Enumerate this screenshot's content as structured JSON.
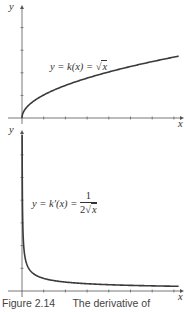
{
  "chart_data": [
    {
      "type": "line",
      "title": "",
      "function_label": "y = k(x) = √x",
      "xlabel": "x",
      "ylabel": "y",
      "grid": false,
      "x_ticks_count": 7,
      "y_ticks_count": 4,
      "series": [
        {
          "name": "k(x) = sqrt(x)",
          "x": [
            0,
            0.25,
            0.5,
            1,
            2,
            3,
            4,
            5,
            6,
            7
          ],
          "values": [
            0,
            0.5,
            0.71,
            1,
            1.41,
            1.73,
            2,
            2.24,
            2.45,
            2.65
          ]
        }
      ],
      "xlim": [
        0,
        7.3
      ],
      "ylim": [
        0,
        4.9
      ]
    },
    {
      "type": "line",
      "title": "",
      "function_label": "y = k'(x) = 1 / (2√x)",
      "xlabel": "x",
      "ylabel": "y",
      "grid": false,
      "x_ticks_count": 7,
      "y_ticks_count": 6,
      "series": [
        {
          "name": "k'(x) = 1/(2 sqrt(x))",
          "x": [
            0.01,
            0.05,
            0.1,
            0.25,
            0.5,
            1,
            2,
            3,
            4,
            5,
            6,
            7
          ],
          "values": [
            5,
            2.24,
            1.58,
            1,
            0.71,
            0.5,
            0.35,
            0.29,
            0.25,
            0.22,
            0.2,
            0.19
          ]
        }
      ],
      "xlim": [
        0,
        7.3
      ],
      "ylim": [
        0,
        6.4
      ]
    }
  ],
  "labels": {
    "top_y_axis": "y",
    "top_x_axis": "x",
    "top_function_prefix": "y = k(x) = ",
    "top_sqrt_arg": "x",
    "bottom_y_axis": "y",
    "bottom_x_axis": "x",
    "bottom_function_prefix": "y = k′(x) = ",
    "bottom_frac_num": "1",
    "bottom_frac_den_coef": "2",
    "bottom_frac_den_arg": "x"
  },
  "caption": "Figure 2.14      The derivative of",
  "colors": {
    "curve": "#3a3a3a",
    "axis": "#555555",
    "text": "#333333"
  }
}
